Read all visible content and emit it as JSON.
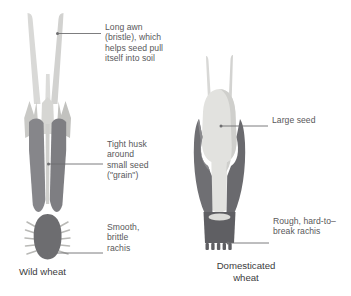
{
  "figure": {
    "background_color": "#ffffff"
  },
  "palette": {
    "awn_light": "#d7d7d5",
    "awn_light_edge": "#c5c5c3",
    "glume_light": "#cdcdca",
    "husk_dark": "#848487",
    "husk_mid": "#9a9a9c",
    "seed_light": "#e3e3e0",
    "rachis_dark": "#6f6f72",
    "leader_line": "#6e6e70",
    "label_text": "#58585a",
    "caption_text": "#3b3b3d"
  },
  "annotations": [
    {
      "id": "long-awn",
      "text": "Long awn\n(bristle), which\nhelps seed pull\nitself into soil",
      "side": "left-plant",
      "points_to": "awn"
    },
    {
      "id": "tight-husk",
      "text": "Tight husk\naround\nsmall seed\n(\"grain\")",
      "side": "left-plant",
      "points_to": "husk"
    },
    {
      "id": "smooth-brittle-rachis",
      "text": "Smooth,\nbrittle\nrachis",
      "side": "left-plant",
      "points_to": "rachis-base"
    },
    {
      "id": "large-seed",
      "text": "Large seed",
      "side": "right-plant",
      "points_to": "seed"
    },
    {
      "id": "rough-rachis",
      "text": "Rough, hard-to–\nbreak rachis",
      "side": "right-plant",
      "points_to": "rachis-base"
    }
  ],
  "captions": [
    {
      "id": "wild",
      "text": "Wild wheat"
    },
    {
      "id": "domesticated",
      "text": "Domesticated\nwheat"
    }
  ]
}
